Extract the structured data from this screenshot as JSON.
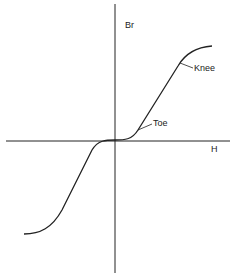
{
  "diagram": {
    "type": "characteristic-curve",
    "axes": {
      "x_label": "H",
      "y_label": "Br"
    },
    "annotations": [
      {
        "label": "Knee"
      },
      {
        "label": "Toe"
      }
    ],
    "colors": {
      "line": "#222222",
      "background": "#ffffff"
    }
  }
}
